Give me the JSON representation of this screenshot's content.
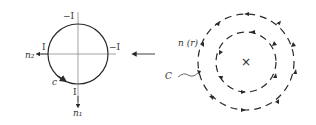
{
  "figure": {
    "mirrored": true,
    "left_panel": {
      "labels": {
        "top": "−I",
        "right": "−I",
        "left": "I",
        "bottom": "I",
        "axis_x": "n₂",
        "axis_y": "n₁",
        "curve": "c"
      }
    },
    "arrow": "transition-arrow",
    "right_panel": {
      "labels": {
        "field": "n (r)",
        "curve": "C",
        "center": "×"
      }
    },
    "colors": {
      "ink": "#2a2a2a",
      "axis": "#8a8a8a"
    }
  }
}
